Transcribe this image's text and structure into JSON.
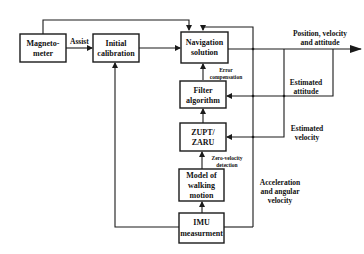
{
  "diagram": {
    "boxes": {
      "magnetometer": [
        "Magneto-",
        "meter"
      ],
      "initial_calibration": [
        "Initial",
        "calibration"
      ],
      "navigation_solution": [
        "Navigation",
        "solution"
      ],
      "filter_algorithm": [
        "Filter",
        "algorithm"
      ],
      "zupt_zaru": [
        "ZUPT/",
        "ZARU"
      ],
      "model_walking": [
        "Model of",
        "walking",
        "motion"
      ],
      "imu": [
        "IMU",
        "measurment"
      ]
    },
    "edge_labels": {
      "assist": "Assist",
      "error_comp": [
        "Error",
        "compensation"
      ],
      "zero_velocity": [
        "Zero-velocity",
        "detection"
      ],
      "output": [
        "Position, velocity",
        "and  attitude"
      ],
      "est_attitude": [
        "Estimated",
        "attitude"
      ],
      "est_velocity": [
        "Estimated",
        "velocity"
      ],
      "accel": [
        "Acceleration",
        "and angular",
        "velocity"
      ]
    }
  }
}
